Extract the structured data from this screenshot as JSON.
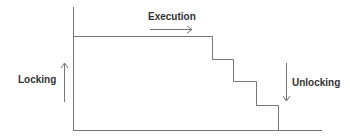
{
  "diagram": {
    "labels": {
      "execution": "Execution",
      "locking": "Locking",
      "unlocking": "Unlocking"
    },
    "colors": {
      "line": "#777777",
      "text": "#333333",
      "background": "#ffffff"
    },
    "steps": [
      {
        "x": 212,
        "y_from": 36,
        "y_to": 59
      },
      {
        "x": 233,
        "y_from": 59,
        "y_to": 81
      },
      {
        "x": 256,
        "y_from": 81,
        "y_to": 105
      },
      {
        "x": 278,
        "y_from": 105,
        "y_to": 130
      }
    ]
  }
}
